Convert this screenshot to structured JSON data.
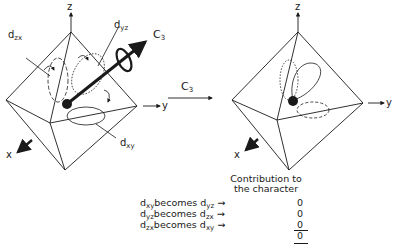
{
  "axes": {
    "z": "z",
    "y": "y",
    "x": "x"
  },
  "left_figure": {
    "labels": {
      "dzx": "d",
      "dzx_sub": "zx",
      "dyz": "d",
      "dyz_sub": "yz",
      "dxy": "d",
      "dxy_sub": "xy",
      "c3": "C",
      "c3_sub": "3"
    }
  },
  "operation_arrow": {
    "label": "C",
    "sub": "3"
  },
  "contribution": {
    "heading_line1": "Contribution to",
    "heading_line2": "the character",
    "rows": [
      {
        "from": "d",
        "from_sub": "xy",
        "verb": "becomes",
        "to": "d",
        "to_sub": "yz",
        "value": "0"
      },
      {
        "from": "d",
        "from_sub": "yz",
        "verb": "becomes",
        "to": "d",
        "to_sub": "zx",
        "value": "0"
      },
      {
        "from": "d",
        "from_sub": "zx",
        "verb": "becomes",
        "to": "d",
        "to_sub": "xy",
        "value": "0"
      }
    ],
    "total": "0"
  },
  "colors": {
    "ink": "#1a1a1a",
    "background": "#ffffff"
  }
}
